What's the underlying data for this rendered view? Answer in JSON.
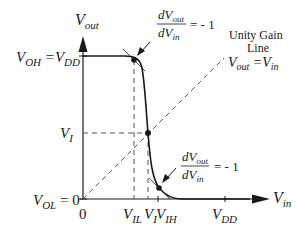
{
  "diagram": {
    "type": "vtc-inverter",
    "y_axis_label": {
      "main": "V",
      "sub": "out"
    },
    "x_axis_label": {
      "main": "V",
      "sub": "in"
    },
    "y_ticks": {
      "voh": {
        "left": "V",
        "left_sub": "OH",
        "eq": " =V",
        "right_sub": "DD"
      },
      "vi": {
        "main": "V",
        "sub": "I"
      },
      "vol": {
        "main": "V",
        "sub": "OL",
        "rest": " = 0"
      }
    },
    "x_ticks": {
      "zero": "0",
      "vil": {
        "main": "V",
        "sub": "IL"
      },
      "vi": {
        "main": "V",
        "sub": "I"
      },
      "vih": {
        "main": "V",
        "sub": "IH"
      },
      "vdd": {
        "main": "V",
        "sub": "DD"
      }
    },
    "slope_annotation_top": {
      "num_main": "dV",
      "num_sub": "out",
      "den_main": "dV",
      "den_sub": "in",
      "equals": "= - 1"
    },
    "slope_annotation_bottom": {
      "num_main": "dV",
      "num_sub": "out",
      "den_main": "dV",
      "den_sub": "in",
      "equals": "= - 1"
    },
    "unity_gain": {
      "line1": "Unity Gain",
      "line2": "Line",
      "eq_left": "V",
      "eq_left_sub": "out",
      "eq_mid": " =V",
      "eq_right_sub": "in"
    },
    "colors": {
      "stroke": "#1a1a1a",
      "dashed": "#555555",
      "background": "#ffffff"
    }
  }
}
